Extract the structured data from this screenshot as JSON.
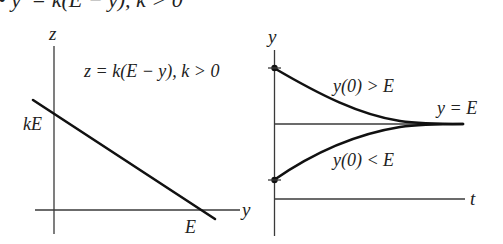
{
  "header": {
    "text": "• y′ = k(E − y), k > 0"
  },
  "left_plot": {
    "vertical_axis_label": "z",
    "horizontal_axis_label": "y",
    "equation": "z = k(E − y), k > 0",
    "intercept_label": "kE",
    "root_label": "E"
  },
  "right_plot": {
    "vertical_axis_label": "y",
    "horizontal_axis_label": "t",
    "equilibrium_label": "y = E",
    "upper_curve_label": "y(0) > E",
    "lower_curve_label": "y(0) < E"
  },
  "colors": {
    "ink": "#111111",
    "axis": "#3a3a3a",
    "background": "#ffffff"
  }
}
